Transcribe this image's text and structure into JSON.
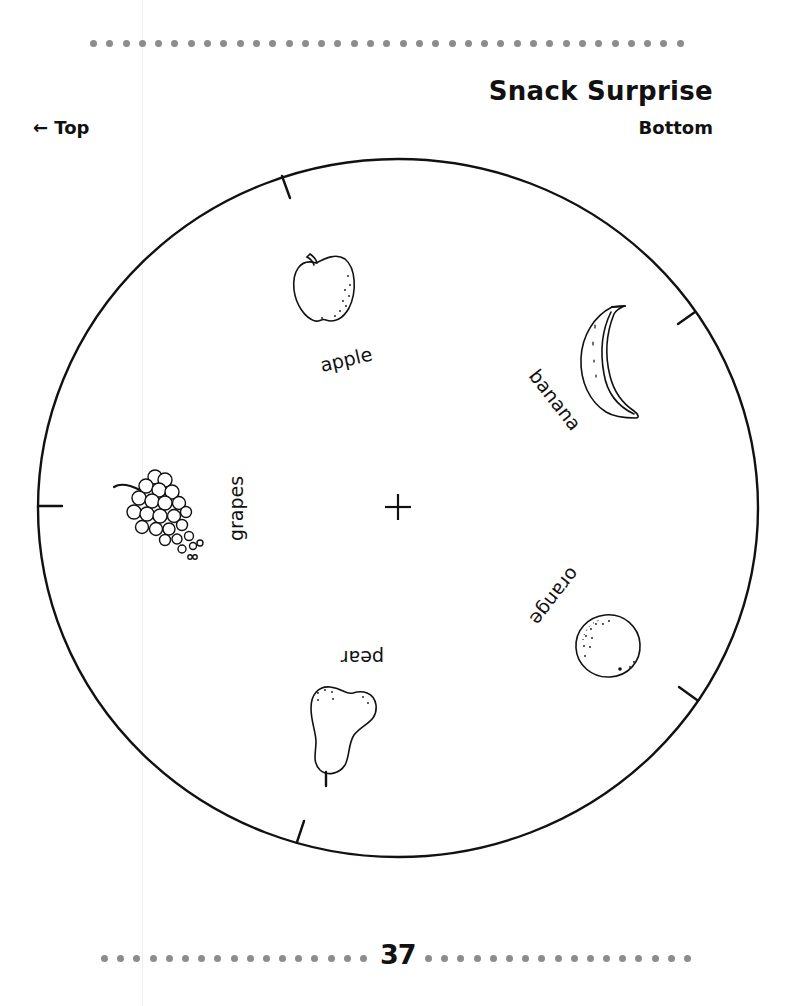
{
  "header": {
    "title": "Snack Surprise",
    "top_label": "← Top",
    "bottom_label": "Bottom"
  },
  "wheel": {
    "center_mark": "+",
    "segments": [
      {
        "label": "apple",
        "icon": "apple-icon"
      },
      {
        "label": "banana",
        "icon": "banana-icon"
      },
      {
        "label": "orange",
        "icon": "orange-icon"
      },
      {
        "label": "pear",
        "icon": "pear-icon"
      },
      {
        "label": "grapes",
        "icon": "grapes-icon"
      }
    ],
    "tick_count": 5
  },
  "footer": {
    "page_number": "37"
  },
  "colors": {
    "ink": "#111111",
    "dots": "#8c8c8c",
    "paper": "#ffffff"
  }
}
